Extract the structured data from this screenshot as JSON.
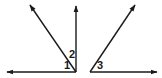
{
  "diagram": {
    "type": "angle-diagram",
    "stroke_color": "#1a1a1a",
    "background": "#ffffff",
    "figures": [
      {
        "name": "left-figure",
        "vertex": [
          76,
          72
        ],
        "rays": [
          {
            "name": "left-horizontal-ray",
            "to": [
              7,
              72
            ]
          },
          {
            "name": "vertical-ray",
            "to": [
              76,
              6
            ]
          },
          {
            "name": "diagonal-up-left-ray",
            "to": [
              30,
              5
            ]
          }
        ],
        "angles": [
          {
            "label": "1",
            "position": [
              64,
              68
            ],
            "between": [
              "left-horizontal-ray",
              "diagonal-up-left-ray"
            ]
          },
          {
            "label": "2",
            "position": [
              69,
              57
            ],
            "between": [
              "diagonal-up-left-ray",
              "vertical-ray"
            ]
          }
        ]
      },
      {
        "name": "right-figure",
        "vertex": [
          90,
          72
        ],
        "rays": [
          {
            "name": "right-horizontal-ray",
            "to": [
              157,
              72
            ]
          },
          {
            "name": "diagonal-up-right-ray",
            "to": [
              135,
              5
            ]
          }
        ],
        "angles": [
          {
            "label": "3",
            "position": [
              97,
              68
            ],
            "between": [
              "right-horizontal-ray",
              "diagonal-up-right-ray"
            ]
          }
        ]
      }
    ]
  }
}
